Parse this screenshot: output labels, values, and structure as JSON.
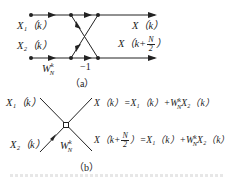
{
  "figure_a": {
    "input_top": "X₁（k）",
    "input_bottom": "X₂（k）",
    "twiddle": "W",
    "twiddle_sup": "k",
    "twiddle_sub": "N",
    "minus_one": "−1",
    "output_top": "X（k）",
    "output_bottom_prefix": "X（k+",
    "output_bottom_num": "N",
    "output_bottom_den": "2",
    "output_bottom_suffix": "）",
    "caption": "（a）"
  },
  "figure_b": {
    "input_top": "X₁（k）",
    "input_bottom": "X₂（k）",
    "twiddle": "W",
    "twiddle_sup": "k",
    "twiddle_sub": "N",
    "output_top": "X（k）=X₁（k）+W",
    "output_top_sup": "k",
    "output_top_sub": "N",
    "output_top_tail": "X₂（k）",
    "output_bottom_prefix": "X（k+",
    "output_bottom_num": "N",
    "output_bottom_den": "2",
    "output_bottom_mid": "）=X₁（k）+W",
    "output_bottom_sup": "k",
    "output_bottom_sub": "N",
    "output_bottom_tail": "X₂（k）",
    "caption": "（b）"
  },
  "colors": {
    "stroke": "#222222",
    "background": "#ffffff"
  }
}
